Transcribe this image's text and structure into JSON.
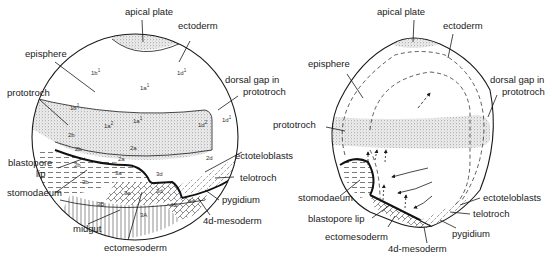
{
  "diagram": {
    "panels": [
      {
        "id": "left",
        "description": "trochophore-stage embryo with cell lineage labels",
        "labels": {
          "apical_plate": "apical plate",
          "ectoderm": "ectoderm",
          "episphere": "episphere",
          "prototroch": "prototroch",
          "dorsal_gap_line1": "dorsal gap in",
          "dorsal_gap_line2": "prototroch",
          "blastopore_line1": "blastopore",
          "blastopore_line2": "lip",
          "stomodaeum": "stomodaeum",
          "ectoteloblasts": "ectoteloblasts",
          "telotroch": "telotroch",
          "pygidium": "pygidium",
          "mesoderm_4d": "4d-mesoderm",
          "midgut": "midgut",
          "ectomesoderm": "ectomesoderm"
        },
        "cells": {
          "c1b1_top": "1b",
          "c1d1_top": "1d",
          "c1a1_top": "1a",
          "c1b1_band": "1b",
          "c1a2": "1a",
          "c1a1_band": "1a",
          "c1d2": "1d",
          "c1d1_right": "1d",
          "c2b_a": "2b",
          "c2b_b": "2b",
          "c2a_a": "2a",
          "c2a_b": "2a",
          "c2d": "2d",
          "c2b_c": "2b",
          "c3a_a": "3a",
          "c3b": "3b",
          "c3d_a": "3d",
          "c3a_b": "3a",
          "c3d_b": "3d",
          "c3B": "3B",
          "c4D": "4D",
          "c4d": "4d",
          "c3A": "3A",
          "sup1": "1",
          "sup2": "2"
        }
      },
      {
        "id": "right",
        "description": "later stage embryo with morphogenetic movement arrows",
        "labels": {
          "apical_plate": "apical plate",
          "ectoderm": "ectoderm",
          "episphere": "episphere",
          "dorsal_gap_line1": "dorsal gap in",
          "dorsal_gap_line2": "prototroch",
          "prototroch": "prototroch",
          "stomodaeum": "stomodaeum",
          "blastopore_lip": "blastopore lip",
          "ectomesoderm": "ectomesoderm",
          "mesoderm_4d": "4d-mesoderm",
          "ectoteloblasts": "ectoteloblasts",
          "telotroch": "telotroch",
          "pygidium": "pygidium"
        }
      }
    ],
    "colors": {
      "ink": "#1a1a1a",
      "stipple_bg": "#e6e6e6",
      "background": "#ffffff"
    }
  }
}
